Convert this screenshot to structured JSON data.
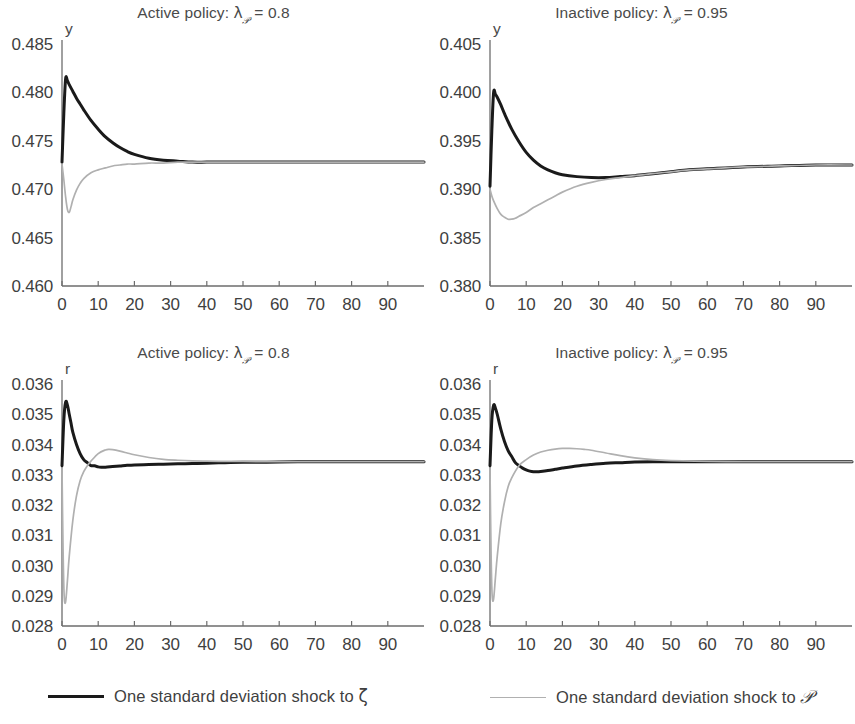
{
  "figure": {
    "width": 855,
    "height": 724,
    "background": "#ffffff"
  },
  "legend": {
    "position": "bottom",
    "entries": [
      {
        "label_prefix": "One standard deviation shock to ",
        "symbol": "ζ",
        "label_full": "One standard deviation shock to ζ",
        "color": "#1a1a1a",
        "style": "solid-thick",
        "series_key": "zeta"
      },
      {
        "label_prefix": "One standard deviation shock to ",
        "symbol": "𝒫",
        "label_full": "One standard deviation shock to 𝒫",
        "color": "#b0b0b0",
        "style": "solid-thin",
        "series_key": "scriptP"
      }
    ]
  },
  "chart_data": [
    {
      "id": "top-left",
      "type": "line",
      "title": "Active policy: λ𝒫 = 0.8",
      "title_parts": {
        "prefix": "Active policy: ",
        "lambda": "λ",
        "subscript": "𝒫",
        "equals": " = ",
        "value": "0.8"
      },
      "xlabel": "",
      "ylabel": "y",
      "xlim": [
        0,
        100
      ],
      "ylim": [
        0.46,
        0.485
      ],
      "xticks": [
        0,
        10,
        20,
        30,
        40,
        50,
        60,
        70,
        80,
        90
      ],
      "yticks": [
        0.46,
        0.465,
        0.47,
        0.475,
        0.48,
        0.485
      ],
      "ytick_labels": [
        "0.460",
        "0.465",
        "0.470",
        "0.475",
        "0.480",
        "0.485"
      ],
      "xtick_labels": [
        "0",
        "10",
        "20",
        "30",
        "40",
        "50",
        "60",
        "70",
        "80",
        "90"
      ],
      "grid": false,
      "series": [
        {
          "name": "One standard deviation shock to ζ",
          "color": "#1a1a1a",
          "width": 3.0,
          "x": [
            0,
            0.5,
            1,
            1.5,
            2,
            3,
            4,
            5,
            6,
            8,
            10,
            12,
            14,
            16,
            18,
            20,
            24,
            28,
            32,
            36,
            40,
            45,
            50,
            55,
            60,
            70,
            80,
            90,
            100
          ],
          "y": [
            0.4728,
            0.4778,
            0.4814,
            0.4812,
            0.4808,
            0.4801,
            0.4794,
            0.4788,
            0.4782,
            0.4771,
            0.4762,
            0.4754,
            0.4748,
            0.4743,
            0.4739,
            0.4736,
            0.4732,
            0.473,
            0.4729,
            0.4728,
            0.4728,
            0.4728,
            0.4728,
            0.4728,
            0.4728,
            0.4728,
            0.4728,
            0.4728,
            0.4728
          ]
        },
        {
          "name": "One standard deviation shock to 𝒫",
          "color": "#b0b0b0",
          "width": 1.7,
          "x": [
            0,
            0.5,
            1,
            1.5,
            2,
            2.5,
            3,
            4,
            5,
            6,
            8,
            10,
            12,
            14,
            16,
            18,
            20,
            24,
            28,
            32,
            36,
            40,
            45,
            50,
            55,
            60,
            70,
            80,
            90,
            100
          ],
          "y": [
            0.4726,
            0.471,
            0.4692,
            0.4679,
            0.4676,
            0.4682,
            0.4689,
            0.4699,
            0.4706,
            0.4711,
            0.4717,
            0.472,
            0.4722,
            0.4724,
            0.4725,
            0.4726,
            0.4726,
            0.4727,
            0.4727,
            0.4728,
            0.4728,
            0.4728,
            0.4728,
            0.4728,
            0.4728,
            0.4728,
            0.4728,
            0.4728,
            0.4728,
            0.4728
          ]
        }
      ]
    },
    {
      "id": "top-right",
      "type": "line",
      "title": "Inactive policy: λ𝒫 = 0.95",
      "title_parts": {
        "prefix": "Inactive policy: ",
        "lambda": "λ",
        "subscript": "𝒫",
        "equals": " = ",
        "value": "0.95"
      },
      "xlabel": "",
      "ylabel": "y",
      "xlim": [
        0,
        100
      ],
      "ylim": [
        0.38,
        0.405
      ],
      "xticks": [
        0,
        10,
        20,
        30,
        40,
        50,
        60,
        70,
        80,
        90
      ],
      "yticks": [
        0.38,
        0.385,
        0.39,
        0.395,
        0.4,
        0.405
      ],
      "ytick_labels": [
        "0.380",
        "0.385",
        "0.390",
        "0.395",
        "0.400",
        "0.405"
      ],
      "xtick_labels": [
        "0",
        "10",
        "20",
        "30",
        "40",
        "50",
        "60",
        "70",
        "80",
        "90"
      ],
      "grid": false,
      "series": [
        {
          "name": "One standard deviation shock to ζ",
          "color": "#1a1a1a",
          "width": 3.0,
          "x": [
            0,
            0.5,
            1,
            1.5,
            2,
            3,
            4,
            6,
            8,
            10,
            12,
            14,
            16,
            18,
            20,
            24,
            28,
            32,
            36,
            40,
            45,
            50,
            55,
            60,
            70,
            80,
            90,
            100
          ],
          "y": [
            0.3903,
            0.396,
            0.4,
            0.3998,
            0.3995,
            0.3987,
            0.3978,
            0.3962,
            0.3949,
            0.3938,
            0.393,
            0.3924,
            0.392,
            0.3917,
            0.3915,
            0.3913,
            0.3912,
            0.3912,
            0.3913,
            0.3914,
            0.3916,
            0.3918,
            0.392,
            0.3921,
            0.3923,
            0.3924,
            0.3925,
            0.3925
          ]
        },
        {
          "name": "One standard deviation shock to 𝒫",
          "color": "#b0b0b0",
          "width": 1.7,
          "x": [
            0,
            0.5,
            1,
            2,
            3,
            4,
            5,
            6,
            7,
            8,
            10,
            12,
            14,
            16,
            18,
            20,
            24,
            28,
            32,
            36,
            40,
            45,
            50,
            55,
            60,
            70,
            80,
            90,
            100
          ],
          "y": [
            0.39,
            0.3893,
            0.3888,
            0.388,
            0.3874,
            0.3871,
            0.3869,
            0.3869,
            0.387,
            0.3872,
            0.3876,
            0.3881,
            0.3885,
            0.3889,
            0.3893,
            0.3897,
            0.3903,
            0.3907,
            0.391,
            0.3912,
            0.3914,
            0.3916,
            0.3918,
            0.392,
            0.3921,
            0.3923,
            0.3924,
            0.3925,
            0.3925
          ]
        }
      ]
    },
    {
      "id": "bottom-left",
      "type": "line",
      "title": "Active policy: λ𝒫 = 0.8",
      "title_parts": {
        "prefix": "Active policy: ",
        "lambda": "λ",
        "subscript": "𝒫",
        "equals": " = ",
        "value": "0.8"
      },
      "xlabel": "",
      "ylabel": "r",
      "xlim": [
        0,
        100
      ],
      "ylim": [
        0.028,
        0.036
      ],
      "xticks": [
        0,
        10,
        20,
        30,
        40,
        50,
        60,
        70,
        80,
        90
      ],
      "yticks": [
        0.028,
        0.029,
        0.03,
        0.031,
        0.032,
        0.033,
        0.034,
        0.035,
        0.036
      ],
      "ytick_labels": [
        "0.028",
        "0.029",
        "0.030",
        "0.031",
        "0.032",
        "0.033",
        "0.034",
        "0.035",
        "0.036"
      ],
      "xtick_labels": [
        "0",
        "10",
        "20",
        "30",
        "40",
        "50",
        "60",
        "70",
        "80",
        "90"
      ],
      "grid": false,
      "series": [
        {
          "name": "One standard deviation shock to ζ",
          "color": "#1a1a1a",
          "width": 3.0,
          "x": [
            0,
            0.5,
            1,
            1.5,
            2,
            2.5,
            3,
            4,
            5,
            6,
            7,
            8,
            9,
            10,
            11,
            12,
            14,
            16,
            18,
            20,
            24,
            28,
            32,
            36,
            40,
            45,
            50,
            60,
            70,
            80,
            90,
            100
          ],
          "y": [
            0.0333,
            0.0348,
            0.0354,
            0.0353,
            0.035,
            0.0347,
            0.0344,
            0.034,
            0.0337,
            0.0335,
            0.0334,
            0.0333,
            0.0333,
            0.03326,
            0.03325,
            0.03325,
            0.03327,
            0.03329,
            0.03331,
            0.03332,
            0.03334,
            0.03335,
            0.03336,
            0.03337,
            0.03338,
            0.0334,
            0.03341,
            0.03342,
            0.03343,
            0.03343,
            0.03343,
            0.03343
          ]
        },
        {
          "name": "One standard deviation shock to 𝒫",
          "color": "#b0b0b0",
          "width": 1.7,
          "x": [
            0,
            0.3,
            0.6,
            1,
            1.5,
            2,
            3,
            4,
            5,
            6,
            7,
            8,
            10,
            12,
            13,
            14,
            16,
            18,
            20,
            24,
            28,
            32,
            36,
            40,
            45,
            50,
            60,
            70,
            80,
            90,
            100
          ],
          "y": [
            0.0332,
            0.0305,
            0.029,
            0.0288,
            0.0295,
            0.0303,
            0.0315,
            0.0323,
            0.0328,
            0.0331,
            0.0333,
            0.03345,
            0.0337,
            0.03382,
            0.03384,
            0.03383,
            0.03378,
            0.03372,
            0.03366,
            0.03357,
            0.03351,
            0.03348,
            0.03346,
            0.03345,
            0.03344,
            0.03344,
            0.03343,
            0.03343,
            0.03343,
            0.03343,
            0.03343
          ]
        }
      ]
    },
    {
      "id": "bottom-right",
      "type": "line",
      "title": "Inactive policy: λ𝒫 = 0.95",
      "title_parts": {
        "prefix": "Inactive policy: ",
        "lambda": "λ",
        "subscript": "𝒫",
        "equals": " = ",
        "value": "0.95"
      },
      "xlabel": "",
      "ylabel": "r",
      "xlim": [
        0,
        100
      ],
      "ylim": [
        0.028,
        0.036
      ],
      "xticks": [
        0,
        10,
        20,
        30,
        40,
        50,
        60,
        70,
        80,
        90
      ],
      "yticks": [
        0.028,
        0.029,
        0.03,
        0.031,
        0.032,
        0.033,
        0.034,
        0.035,
        0.036
      ],
      "ytick_labels": [
        "0.028",
        "0.029",
        "0.030",
        "0.031",
        "0.032",
        "0.033",
        "0.034",
        "0.035",
        "0.036"
      ],
      "xtick_labels": [
        "0",
        "10",
        "20",
        "30",
        "40",
        "50",
        "60",
        "70",
        "80",
        "90"
      ],
      "grid": false,
      "series": [
        {
          "name": "One standard deviation shock to ζ",
          "color": "#1a1a1a",
          "width": 3.0,
          "x": [
            0,
            0.5,
            1,
            1.5,
            2,
            3,
            4,
            5,
            6,
            7,
            8,
            9,
            10,
            11,
            12,
            13,
            14,
            16,
            18,
            20,
            24,
            28,
            32,
            36,
            40,
            45,
            50,
            60,
            70,
            80,
            90,
            100
          ],
          "y": [
            0.0333,
            0.0348,
            0.0353,
            0.0352,
            0.035,
            0.0345,
            0.0341,
            0.0338,
            0.0336,
            0.0334,
            0.0333,
            0.03322,
            0.03316,
            0.03312,
            0.0331,
            0.0331,
            0.03311,
            0.03314,
            0.03318,
            0.03322,
            0.03329,
            0.03334,
            0.03338,
            0.0334,
            0.03342,
            0.03343,
            0.03343,
            0.03343,
            0.03343,
            0.03343,
            0.03343,
            0.03343
          ]
        },
        {
          "name": "One standard deviation shock to 𝒫",
          "color": "#b0b0b0",
          "width": 1.7,
          "x": [
            0,
            0.3,
            0.6,
            1,
            1.5,
            2,
            3,
            4,
            5,
            6,
            8,
            10,
            12,
            14,
            16,
            18,
            20,
            22,
            24,
            26,
            28,
            32,
            36,
            40,
            45,
            50,
            60,
            70,
            80,
            90,
            100
          ],
          "y": [
            0.0332,
            0.0304,
            0.029,
            0.0289,
            0.0296,
            0.0303,
            0.0314,
            0.0321,
            0.0326,
            0.0329,
            0.0333,
            0.0335,
            0.03365,
            0.03375,
            0.03381,
            0.03385,
            0.03387,
            0.03387,
            0.03386,
            0.03384,
            0.03381,
            0.03372,
            0.03363,
            0.03356,
            0.0335,
            0.03347,
            0.03344,
            0.03343,
            0.03343,
            0.03343,
            0.03343
          ]
        }
      ]
    }
  ]
}
